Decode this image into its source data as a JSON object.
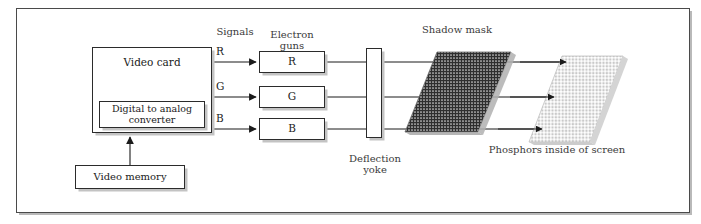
{
  "figure": {
    "frame": {
      "border_color": "#4a4a4a"
    }
  },
  "blocks": [
    {
      "id": "video-card",
      "label": "Video card",
      "x": 92,
      "y": 47,
      "w": 120,
      "h": 86,
      "font": 10.5
    },
    {
      "id": "dac",
      "label": "Digital to analog\nconverter",
      "x": 99,
      "y": 101,
      "w": 106,
      "h": 27,
      "font": 9.5
    },
    {
      "id": "video-memory",
      "label": "Video memory",
      "x": 75,
      "y": 165,
      "w": 110,
      "h": 24,
      "font": 10
    },
    {
      "id": "gun-red",
      "label": "R",
      "x": 259,
      "y": 51,
      "w": 66,
      "h": 22,
      "font": 10.5
    },
    {
      "id": "gun-green",
      "label": "G",
      "x": 259,
      "y": 86,
      "w": 66,
      "h": 22,
      "font": 10.5
    },
    {
      "id": "gun-blue",
      "label": "B",
      "x": 259,
      "y": 118,
      "w": 66,
      "h": 22,
      "font": 10.5
    },
    {
      "id": "deflection-yoke",
      "label": "",
      "x": 366,
      "y": 48,
      "w": 16,
      "h": 90,
      "font": 10
    }
  ],
  "labels": {
    "signals": {
      "text": "Signals",
      "x": 207,
      "y": 26,
      "w": 56,
      "font": 10
    },
    "electron_guns": {
      "text": "Electron\nguns",
      "x": 261,
      "y": 18,
      "w": 62,
      "font": 10
    },
    "shadow_mask": {
      "text": "Shadow mask",
      "x": 409,
      "y": 24,
      "w": 96,
      "font": 10
    },
    "deflection_yoke": {
      "text": "Deflection\nyoke",
      "x": 340,
      "y": 142,
      "w": 70,
      "font": 10
    },
    "phosphors": {
      "text": "Phosphors inside of screen",
      "x": 477,
      "y": 144,
      "w": 160,
      "font": 10
    }
  },
  "signal_labels": [
    {
      "id": "signal-r",
      "text": "R",
      "x": 216,
      "y": 46,
      "font": 10.5
    },
    {
      "id": "signal-g",
      "text": "G",
      "x": 216,
      "y": 81,
      "font": 10.5
    },
    {
      "id": "signal-b",
      "text": "B",
      "x": 216,
      "y": 113,
      "font": 10.5
    }
  ],
  "shadow_mask_shape": {
    "points": "437,52 511,52 478,132 405,132",
    "fill": "#2e2e2e",
    "edge": "#9a9a9a"
  },
  "phosphor_shape": {
    "points": "562,56 623,56 590,142 529,142",
    "fill": "#cfcfcf",
    "edge": "#b5b5b5"
  },
  "beam_rows": [
    {
      "id": "beam-red",
      "y": 62
    },
    {
      "id": "beam-green",
      "y": 97
    },
    {
      "id": "beam-blue",
      "y": 129
    }
  ],
  "colors": {
    "line": "#2b2b2b",
    "shadow": "#c3c3c3",
    "text": "#1b1b1b",
    "label_text": "#3a3a3a"
  }
}
